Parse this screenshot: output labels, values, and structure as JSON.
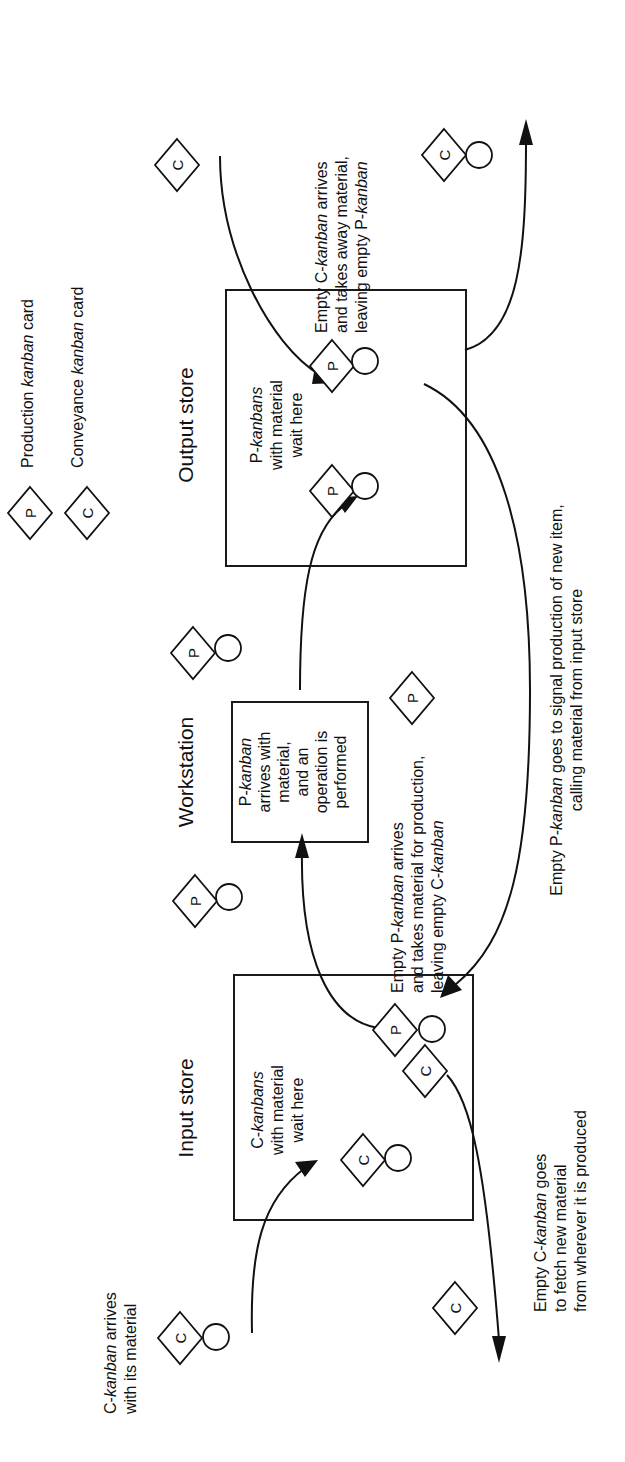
{
  "diagram": {
    "legend": {
      "production": {
        "glyph": "P",
        "label_pre": "Production ",
        "label_it": "kanban",
        "label_post": " card"
      },
      "conveyance": {
        "glyph": "C",
        "label_pre": "Conveyance ",
        "label_it": "kanban",
        "label_post": " card"
      }
    },
    "stations": {
      "output": {
        "title": "Output store",
        "desc": [
          {
            "pre": "P-",
            "it": "kanbans",
            "post": ""
          },
          {
            "pre": "with material",
            "it": "",
            "post": ""
          },
          {
            "pre": "wait here",
            "it": "",
            "post": ""
          }
        ]
      },
      "workstation": {
        "title": "Workstation",
        "desc": [
          {
            "pre": "P-",
            "it": "kanban",
            "post": ""
          },
          {
            "pre": "arrives with",
            "it": "",
            "post": ""
          },
          {
            "pre": "material,",
            "it": "",
            "post": ""
          },
          {
            "pre": "and an",
            "it": "",
            "post": ""
          },
          {
            "pre": "operation is",
            "it": "",
            "post": ""
          },
          {
            "pre": "performed",
            "it": "",
            "post": ""
          }
        ]
      },
      "input": {
        "title": "Input store",
        "desc": [
          {
            "pre": "C-",
            "it": "kanbans",
            "post": ""
          },
          {
            "pre": "with material",
            "it": "",
            "post": ""
          },
          {
            "pre": "wait here",
            "it": "",
            "post": ""
          }
        ]
      }
    },
    "annotations": {
      "c_takes_away": [
        {
          "pre": "Empty C-",
          "it": "kanban",
          "post": " arrives"
        },
        {
          "pre": "and takes away material,",
          "it": "",
          "post": ""
        },
        {
          "pre": "leaving empty P-",
          "it": "kanban",
          "post": ""
        }
      ],
      "p_takes_material": [
        {
          "pre": "Empty P-",
          "it": "kanban",
          "post": " arrives"
        },
        {
          "pre": "and takes material for production,",
          "it": "",
          "post": ""
        },
        {
          "pre": "leaving empty C-",
          "it": "kanban",
          "post": ""
        }
      ],
      "p_signal": [
        {
          "pre": "Empty P-",
          "it": "kanban",
          "post": " goes to signal production of new item,"
        },
        {
          "pre": "calling material from input store",
          "it": "",
          "post": ""
        }
      ],
      "c_fetch": [
        {
          "pre": "Empty C-",
          "it": "kanban",
          "post": " goes"
        },
        {
          "pre": "to fetch new material",
          "it": "",
          "post": ""
        },
        {
          "pre": "from wherever it is produced",
          "it": "",
          "post": ""
        }
      ],
      "c_arrives": [
        {
          "pre": "C-",
          "it": "kanban",
          "post": " arrives"
        },
        {
          "pre": "with its material",
          "it": "",
          "post": ""
        }
      ]
    },
    "glyphs": {
      "p": "P",
      "c": "C"
    }
  }
}
